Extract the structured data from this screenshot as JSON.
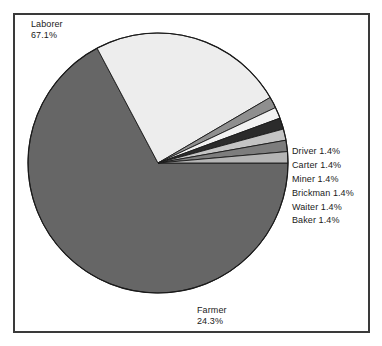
{
  "chart_data": {
    "type": "pie",
    "title": "",
    "xlabel": "",
    "ylabel": "",
    "legend_position": "none",
    "grid": false,
    "labels_show_percent": true,
    "start_angle_deg": 0,
    "direction": "clockwise",
    "categories": [
      "Laborer",
      "Farmer",
      "Driver",
      "Carter",
      "Miner",
      "Brickman",
      "Waiter",
      "Baker"
    ],
    "values": [
      67.1,
      24.3,
      1.4,
      1.4,
      1.4,
      1.4,
      1.4,
      1.4
    ],
    "slices": [
      {
        "label": "Laborer",
        "percent": 67.1,
        "percent_text": "67.1%",
        "color": "#666666",
        "label_placement": "top-left"
      },
      {
        "label": "Farmer",
        "percent": 24.3,
        "percent_text": "24.3%",
        "color": "#ededed",
        "label_placement": "bottom"
      },
      {
        "label": "Driver",
        "percent": 1.4,
        "percent_text": "1.4%",
        "color": "#8f8f8f",
        "label_placement": "right"
      },
      {
        "label": "Carter",
        "percent": 1.4,
        "percent_text": "1.4%",
        "color": "#f2f2f2",
        "label_placement": "right"
      },
      {
        "label": "Miner",
        "percent": 1.4,
        "percent_text": "1.4%",
        "color": "#2b2b2b",
        "label_placement": "right"
      },
      {
        "label": "Brickman",
        "percent": 1.4,
        "percent_text": "1.4%",
        "color": "#c4c4c4",
        "label_placement": "right"
      },
      {
        "label": "Waiter",
        "percent": 1.4,
        "percent_text": "1.4%",
        "color": "#7d7d7d",
        "label_placement": "right"
      },
      {
        "label": "Baker",
        "percent": 1.4,
        "percent_text": "1.4%",
        "color": "#b5b5b5",
        "label_placement": "right"
      }
    ]
  },
  "labels": {
    "laborer_name": "Laborer",
    "laborer_pct": "67.1%",
    "farmer_name": "Farmer",
    "farmer_pct": "24.3%",
    "driver": "Driver 1.4%",
    "carter": "Carter 1.4%",
    "miner": "Miner 1.4%",
    "brickman": "Brickman 1.4%",
    "waiter": "Waiter 1.4%",
    "baker": "Baker 1.4%"
  },
  "style": {
    "frame_border_color": "#3a3a3a",
    "background": "#ffffff",
    "pie_outline_color": "#1a1a1a",
    "text_color": "#1a1a1a"
  },
  "geometry": {
    "center_x": 158,
    "center_y": 163,
    "radius": 130
  }
}
